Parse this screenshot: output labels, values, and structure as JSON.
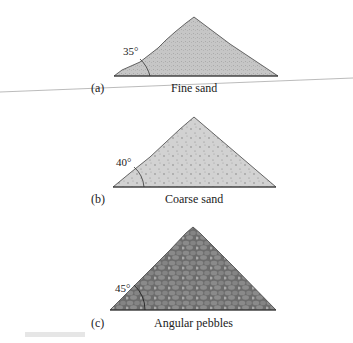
{
  "panels": [
    {
      "letter": "(a)",
      "name": "Fine sand",
      "angle": "35°",
      "fill": "#c8c8c8",
      "texture": "fine-stipple"
    },
    {
      "letter": "(b)",
      "name": "Coarse sand",
      "angle": "40°",
      "fill": "#d0d0d0",
      "texture": "coarse-dots"
    },
    {
      "letter": "(c)",
      "name": "Angular pebbles",
      "angle": "45°",
      "fill": "#7f7f7f",
      "texture": "pebbles"
    }
  ]
}
